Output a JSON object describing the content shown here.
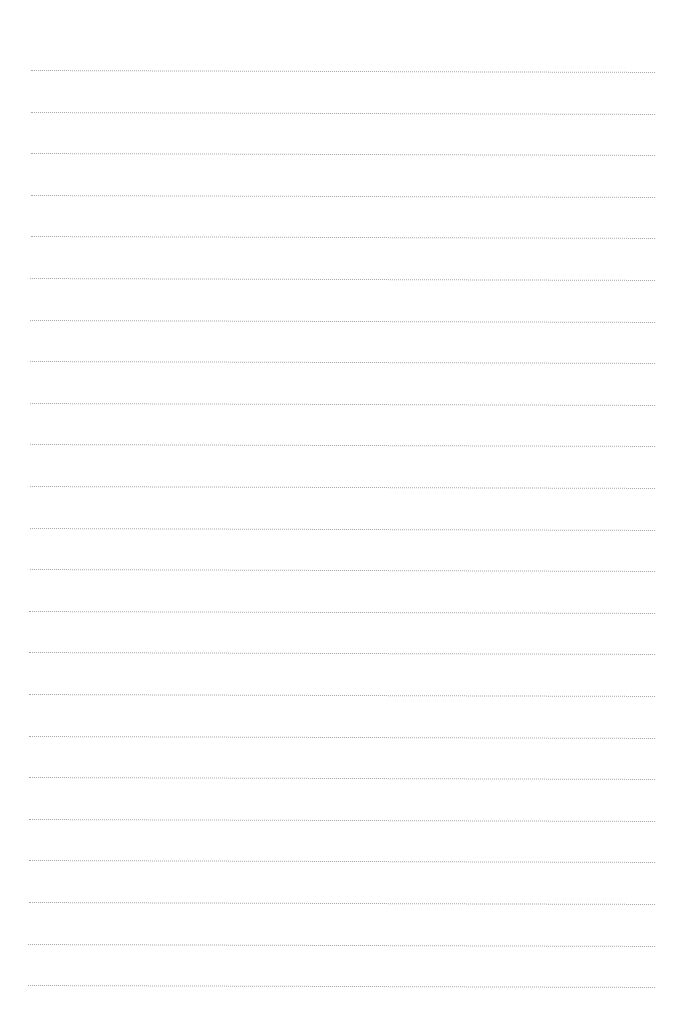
{
  "page": {
    "type": "lined-paper",
    "background_color": "#ffffff",
    "rule_color": "#8a8a8a",
    "rule_style": "dotted"
  },
  "rules": {
    "count": 23,
    "first_y": 70,
    "spacing": 41.6,
    "left_x": 31,
    "right_x": 655,
    "tilt_deg": 0.18
  }
}
